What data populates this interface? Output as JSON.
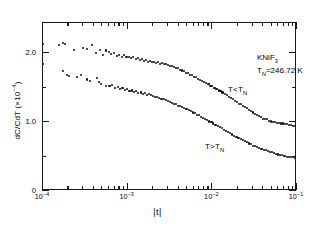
{
  "figure": {
    "x_axis_title": "|t|",
    "y_axis_title_main": "dC/CdT  (×10",
    "y_axis_title_exp": "−4",
    "y_axis_title_tail": ")",
    "sample_formula_main": "KNiF",
    "sample_formula_sub": "3",
    "neel_symbol": "T",
    "neel_sub": "N",
    "neel_value": "=246.72 K",
    "series_label_below_main": "T<T",
    "series_label_below_sub": "N",
    "series_label_above_main": "T>T",
    "series_label_above_sub": "N",
    "xticklabels": [
      {
        "mantissa": "10",
        "exponent": "−4",
        "value": 0.0001
      },
      {
        "mantissa": "10",
        "exponent": "−3",
        "value": 0.001
      },
      {
        "mantissa": "10",
        "exponent": "−2",
        "value": 0.01
      },
      {
        "mantissa": "10",
        "exponent": "−1",
        "value": 0.1
      }
    ],
    "yticklabels": [
      {
        "label": "0",
        "value": 0
      },
      {
        "label": "1.0",
        "value": 1.0
      },
      {
        "label": "2.0",
        "value": 2.0
      }
    ]
  },
  "chart_data": {
    "type": "scatter",
    "title": "",
    "xlabel": "|t|",
    "ylabel": "dC/CdT (×10⁻⁴)",
    "xscale": "log",
    "yscale": "linear",
    "xlim": [
      0.0001,
      0.1
    ],
    "ylim": [
      0,
      2.44
    ],
    "xticks": [
      0.0001,
      0.001,
      0.01,
      0.1
    ],
    "yticks": [
      0,
      1.0,
      2.0
    ],
    "grid": false,
    "legend": "none",
    "annotations": [
      {
        "text": "KNiF3",
        "x": 0.03,
        "y": 2.25
      },
      {
        "text": "TN=246.72 K",
        "x": 0.03,
        "y": 2.08
      },
      {
        "text": "T<TN",
        "x": 0.0026,
        "y": 1.93
      },
      {
        "text": "T>TN",
        "x": 0.0014,
        "y": 1.05
      }
    ],
    "series": [
      {
        "name": "T<TN",
        "marker": "point",
        "color": "#111111",
        "points": [
          [
            0.0001,
            2.14
          ],
          [
            0.000155,
            2.12
          ],
          [
            0.000172,
            2.15
          ],
          [
            0.00018,
            2.13
          ],
          [
            0.00023,
            2.05
          ],
          [
            0.000295,
            2.08
          ],
          [
            0.00033,
            2.06
          ],
          [
            0.000375,
            2.12
          ],
          [
            0.000425,
            2.01
          ],
          [
            0.00047,
            2.05
          ],
          [
            0.000515,
            1.98
          ],
          [
            0.000555,
            2.04
          ],
          [
            0.0006,
            2.02
          ],
          [
            0.00064,
            1.99
          ],
          [
            0.00069,
            2.0
          ],
          [
            0.00074,
            1.96
          ],
          [
            0.000795,
            1.98
          ],
          [
            0.00085,
            1.94
          ],
          [
            0.00091,
            1.97
          ],
          [
            0.00097,
            1.95
          ],
          [
            0.00103,
            1.95
          ],
          [
            0.0011,
            1.93
          ],
          [
            0.00117,
            1.94
          ],
          [
            0.00124,
            1.92
          ],
          [
            0.00131,
            1.93
          ],
          [
            0.00139,
            1.9
          ],
          [
            0.00147,
            1.92
          ],
          [
            0.00156,
            1.89
          ],
          [
            0.00165,
            1.9
          ],
          [
            0.00174,
            1.88
          ],
          [
            0.00184,
            1.89
          ],
          [
            0.00194,
            1.87
          ],
          [
            0.00205,
            1.88
          ],
          [
            0.00217,
            1.86
          ],
          [
            0.00229,
            1.87
          ],
          [
            0.00242,
            1.85
          ],
          [
            0.00256,
            1.86
          ],
          [
            0.0027,
            1.84
          ],
          [
            0.00285,
            1.85
          ],
          [
            0.00301,
            1.83
          ],
          [
            0.00318,
            1.82
          ],
          [
            0.00336,
            1.81
          ],
          [
            0.00355,
            1.8
          ],
          [
            0.00375,
            1.79
          ],
          [
            0.00396,
            1.78
          ],
          [
            0.00418,
            1.76
          ],
          [
            0.00442,
            1.75
          ],
          [
            0.00467,
            1.74
          ],
          [
            0.00493,
            1.72
          ],
          [
            0.00521,
            1.71
          ],
          [
            0.0055,
            1.69
          ],
          [
            0.00581,
            1.68
          ],
          [
            0.00614,
            1.66
          ],
          [
            0.00648,
            1.65
          ],
          [
            0.00685,
            1.63
          ],
          [
            0.00723,
            1.61
          ],
          [
            0.00764,
            1.6
          ],
          [
            0.00807,
            1.58
          ],
          [
            0.00852,
            1.57
          ],
          [
            0.009,
            1.55
          ],
          [
            0.00951,
            1.53
          ],
          [
            0.01,
            1.52
          ],
          [
            0.0106,
            1.5
          ],
          [
            0.0112,
            1.48
          ],
          [
            0.0119,
            1.46
          ],
          [
            0.0125,
            1.45
          ],
          [
            0.0132,
            1.43
          ],
          [
            0.014,
            1.41
          ],
          [
            0.0148,
            1.39
          ],
          [
            0.0156,
            1.37
          ],
          [
            0.0165,
            1.35
          ],
          [
            0.0174,
            1.33
          ],
          [
            0.0184,
            1.31
          ],
          [
            0.0194,
            1.29
          ],
          [
            0.0205,
            1.27
          ],
          [
            0.0217,
            1.26
          ],
          [
            0.0229,
            1.24
          ],
          [
            0.0242,
            1.22
          ],
          [
            0.0256,
            1.2
          ],
          [
            0.027,
            1.18
          ],
          [
            0.0285,
            1.16
          ],
          [
            0.0301,
            1.14
          ],
          [
            0.0318,
            1.12
          ],
          [
            0.0336,
            1.1
          ],
          [
            0.0355,
            1.09
          ],
          [
            0.0375,
            1.07
          ],
          [
            0.0396,
            1.05
          ],
          [
            0.0418,
            1.04
          ],
          [
            0.0442,
            1.04
          ],
          [
            0.0467,
            1.02
          ],
          [
            0.0493,
            1.01
          ],
          [
            0.0521,
            1.0
          ],
          [
            0.055,
            1.0
          ],
          [
            0.0581,
            0.99
          ],
          [
            0.0614,
            0.99
          ],
          [
            0.0648,
            0.98
          ],
          [
            0.0685,
            0.98
          ],
          [
            0.0723,
            0.97
          ],
          [
            0.0764,
            0.97
          ],
          [
            0.0807,
            0.96
          ],
          [
            0.0852,
            0.96
          ],
          [
            0.09,
            0.95
          ],
          [
            0.0951,
            0.95
          ],
          [
            0.1,
            0.95
          ]
        ]
      },
      {
        "name": "T>TN",
        "marker": "point",
        "color": "#111111",
        "points": [
          [
            0.0001,
            1.85
          ],
          [
            0.000172,
            1.74
          ],
          [
            0.00019,
            1.68
          ],
          [
            0.000205,
            1.67
          ],
          [
            0.000255,
            1.66
          ],
          [
            0.00028,
            1.69
          ],
          [
            0.00033,
            1.62
          ],
          [
            0.000355,
            1.6
          ],
          [
            0.00043,
            1.64
          ],
          [
            0.00046,
            1.58
          ],
          [
            0.000485,
            1.56
          ],
          [
            0.00056,
            1.53
          ],
          [
            0.00061,
            1.52
          ],
          [
            0.00066,
            1.54
          ],
          [
            0.00071,
            1.5
          ],
          [
            0.00076,
            1.51
          ],
          [
            0.000815,
            1.48
          ],
          [
            0.00087,
            1.49
          ],
          [
            0.00093,
            1.47
          ],
          [
            0.00099,
            1.48
          ],
          [
            0.00105,
            1.45
          ],
          [
            0.00112,
            1.46
          ],
          [
            0.00119,
            1.44
          ],
          [
            0.00126,
            1.45
          ],
          [
            0.00134,
            1.42
          ],
          [
            0.00142,
            1.43
          ],
          [
            0.0015,
            1.41
          ],
          [
            0.00159,
            1.42
          ],
          [
            0.00169,
            1.4
          ],
          [
            0.00179,
            1.41
          ],
          [
            0.00189,
            1.39
          ],
          [
            0.002,
            1.38
          ],
          [
            0.00212,
            1.37
          ],
          [
            0.00224,
            1.36
          ],
          [
            0.00237,
            1.35
          ],
          [
            0.00251,
            1.34
          ],
          [
            0.00266,
            1.33
          ],
          [
            0.00281,
            1.32
          ],
          [
            0.00298,
            1.31
          ],
          [
            0.00315,
            1.29
          ],
          [
            0.00333,
            1.28
          ],
          [
            0.00353,
            1.27
          ],
          [
            0.00373,
            1.26
          ],
          [
            0.00395,
            1.24
          ],
          [
            0.00418,
            1.23
          ],
          [
            0.00442,
            1.22
          ],
          [
            0.00468,
            1.2
          ],
          [
            0.00495,
            1.19
          ],
          [
            0.00524,
            1.17
          ],
          [
            0.00554,
            1.16
          ],
          [
            0.00587,
            1.14
          ],
          [
            0.00621,
            1.13
          ],
          [
            0.00657,
            1.11
          ],
          [
            0.00695,
            1.1
          ],
          [
            0.00736,
            1.08
          ],
          [
            0.00779,
            1.06
          ],
          [
            0.00824,
            1.05
          ],
          [
            0.00872,
            1.03
          ],
          [
            0.00923,
            1.01
          ],
          [
            0.00977,
            1.0
          ],
          [
            0.0103,
            0.98
          ],
          [
            0.0109,
            0.96
          ],
          [
            0.0116,
            0.94
          ],
          [
            0.0122,
            0.93
          ],
          [
            0.013,
            0.91
          ],
          [
            0.0137,
            0.89
          ],
          [
            0.0145,
            0.87
          ],
          [
            0.0154,
            0.86
          ],
          [
            0.0163,
            0.84
          ],
          [
            0.0172,
            0.82
          ],
          [
            0.0182,
            0.8
          ],
          [
            0.0193,
            0.79
          ],
          [
            0.0204,
            0.77
          ],
          [
            0.0216,
            0.75
          ],
          [
            0.0229,
            0.74
          ],
          [
            0.0242,
            0.72
          ],
          [
            0.0256,
            0.71
          ],
          [
            0.0271,
            0.69
          ],
          [
            0.0287,
            0.68
          ],
          [
            0.0304,
            0.66
          ],
          [
            0.0321,
            0.65
          ],
          [
            0.034,
            0.64
          ],
          [
            0.036,
            0.62
          ],
          [
            0.0381,
            0.61
          ],
          [
            0.0403,
            0.6
          ],
          [
            0.0427,
            0.59
          ],
          [
            0.0452,
            0.58
          ],
          [
            0.0478,
            0.57
          ],
          [
            0.0506,
            0.56
          ],
          [
            0.0536,
            0.55
          ],
          [
            0.0567,
            0.54
          ],
          [
            0.06,
            0.53
          ],
          [
            0.0635,
            0.52
          ],
          [
            0.0672,
            0.52
          ],
          [
            0.0711,
            0.51
          ],
          [
            0.0753,
            0.5
          ],
          [
            0.0797,
            0.5
          ],
          [
            0.0843,
            0.49
          ],
          [
            0.0892,
            0.49
          ],
          [
            0.0944,
            0.48
          ],
          [
            0.1,
            0.48
          ]
        ]
      }
    ]
  }
}
